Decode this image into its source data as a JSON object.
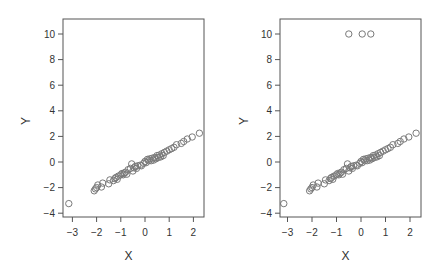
{
  "chart_data": [
    {
      "type": "scatter",
      "title": "",
      "xlabel": "X",
      "ylabel": "Y",
      "xlim": [
        -3.35,
        2.45
      ],
      "ylim": [
        -4.35,
        11.0
      ],
      "xticks": [
        -3,
        -2,
        -1,
        0,
        1,
        2
      ],
      "xtick_labels": [
        "−3",
        "−2",
        "−1",
        "0",
        "1",
        "2"
      ],
      "yticks": [
        -4,
        -2,
        0,
        2,
        4,
        6,
        8,
        10
      ],
      "ytick_labels": [
        "−4",
        "−2",
        "0",
        "2",
        "4",
        "6",
        "8",
        "10"
      ],
      "grid": false,
      "legend": null,
      "marker": "open-circle",
      "marker_color": "#7a7a7a",
      "series": [
        {
          "name": "data",
          "x": [
            -3.15,
            -2.1,
            -2.05,
            -2.0,
            -1.95,
            -1.8,
            -1.75,
            -1.5,
            -1.45,
            -1.3,
            -1.25,
            -1.2,
            -1.15,
            -1.1,
            -1.0,
            -0.95,
            -0.9,
            -0.85,
            -0.8,
            -0.75,
            -0.7,
            -0.6,
            -0.55,
            -0.5,
            -0.45,
            -0.4,
            -0.35,
            -0.3,
            -0.2,
            -0.15,
            -0.05,
            0.0,
            0.05,
            0.1,
            0.15,
            0.2,
            0.25,
            0.3,
            0.35,
            0.4,
            0.45,
            0.5,
            0.55,
            0.6,
            0.65,
            0.7,
            0.75,
            0.8,
            0.9,
            1.0,
            1.1,
            1.2,
            1.3,
            1.5,
            1.6,
            1.75,
            1.95,
            2.25
          ],
          "y": [
            -3.25,
            -2.25,
            -2.1,
            -2.0,
            -1.8,
            -1.95,
            -1.65,
            -1.7,
            -1.4,
            -1.45,
            -1.3,
            -1.2,
            -1.35,
            -1.1,
            -1.0,
            -0.9,
            -1.0,
            -0.85,
            -0.8,
            -0.95,
            -0.6,
            -0.5,
            -0.15,
            -0.7,
            -0.45,
            -0.35,
            -0.5,
            -0.3,
            -0.25,
            -0.3,
            -0.1,
            0.05,
            -0.05,
            0.2,
            0.1,
            0.25,
            0.1,
            0.3,
            0.15,
            0.35,
            0.25,
            0.5,
            0.35,
            0.55,
            0.4,
            0.65,
            0.5,
            0.75,
            0.85,
            0.95,
            1.05,
            1.15,
            1.35,
            1.45,
            1.6,
            1.8,
            1.95,
            2.25
          ]
        }
      ]
    },
    {
      "type": "scatter",
      "title": "",
      "xlabel": "X",
      "ylabel": "Y",
      "xlim": [
        -3.35,
        2.45
      ],
      "ylim": [
        -4.35,
        11.0
      ],
      "xticks": [
        -3,
        -2,
        -1,
        0,
        1,
        2
      ],
      "xtick_labels": [
        "−3",
        "−2",
        "−1",
        "0",
        "1",
        "2"
      ],
      "yticks": [
        -4,
        -2,
        0,
        2,
        4,
        6,
        8,
        10
      ],
      "ytick_labels": [
        "−4",
        "−2",
        "0",
        "2",
        "4",
        "6",
        "8",
        "10"
      ],
      "grid": false,
      "legend": null,
      "marker": "open-circle",
      "marker_color": "#7a7a7a",
      "annotations": [
        "three outliers at Y = 10"
      ],
      "series": [
        {
          "name": "data",
          "x": [
            -3.15,
            -2.1,
            -2.05,
            -2.0,
            -1.95,
            -1.8,
            -1.75,
            -1.5,
            -1.45,
            -1.3,
            -1.25,
            -1.2,
            -1.15,
            -1.1,
            -1.0,
            -0.95,
            -0.9,
            -0.85,
            -0.8,
            -0.75,
            -0.7,
            -0.6,
            -0.55,
            -0.5,
            -0.45,
            -0.4,
            -0.35,
            -0.3,
            -0.2,
            -0.15,
            -0.05,
            0.0,
            0.05,
            0.1,
            0.15,
            0.2,
            0.25,
            0.3,
            0.35,
            0.4,
            0.45,
            0.5,
            0.55,
            0.6,
            0.65,
            0.7,
            0.75,
            0.8,
            0.9,
            1.0,
            1.1,
            1.2,
            1.3,
            1.5,
            1.6,
            1.75,
            1.95,
            2.25,
            -0.5,
            0.05,
            0.4
          ],
          "y": [
            -3.25,
            -2.25,
            -2.1,
            -2.0,
            -1.8,
            -1.95,
            -1.65,
            -1.7,
            -1.4,
            -1.45,
            -1.3,
            -1.2,
            -1.35,
            -1.1,
            -1.0,
            -0.9,
            -1.0,
            -0.85,
            -0.8,
            -0.95,
            -0.6,
            -0.5,
            -0.15,
            -0.7,
            -0.45,
            -0.35,
            -0.5,
            -0.3,
            -0.25,
            -0.3,
            -0.1,
            0.05,
            -0.05,
            0.2,
            0.1,
            0.25,
            0.1,
            0.3,
            0.15,
            0.35,
            0.25,
            0.5,
            0.35,
            0.55,
            0.4,
            0.65,
            0.5,
            0.75,
            0.85,
            0.95,
            1.05,
            1.15,
            1.35,
            1.45,
            1.6,
            1.8,
            1.95,
            2.25,
            10,
            10,
            10
          ]
        }
      ]
    }
  ],
  "layout": {
    "panels": [
      {
        "box": {
          "left": 63,
          "top": 19,
          "right": 204,
          "bottom": 217
        },
        "x0px": 145,
        "xunit": 24.2,
        "y0px": 162,
        "yunit": 12.8,
        "ylabel_x": 30
      },
      {
        "box": {
          "left": 280,
          "top": 19,
          "right": 421,
          "bottom": 217
        },
        "x0px": 361,
        "xunit": 24.5,
        "y0px": 162,
        "yunit": 12.8,
        "ylabel_x": 248
      }
    ],
    "colors": {
      "axis": "#555555",
      "marker": "#7a7a7a",
      "text": "#333333"
    }
  }
}
